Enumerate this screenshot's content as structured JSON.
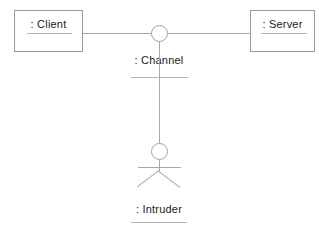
{
  "diagram": {
    "type": "uml-deployment-collaboration",
    "background_color": "#ffffff",
    "line_color": "#a8a8a8",
    "text_color": "#1a1a1a",
    "nodes": [
      {
        "id": "client",
        "shape": "rectangle",
        "label": ": Client",
        "underlined": true
      },
      {
        "id": "server",
        "shape": "rectangle",
        "label": ": Server",
        "underlined": true
      },
      {
        "id": "channel",
        "shape": "circle",
        "label": ": Channel",
        "underlined": true
      },
      {
        "id": "intruder",
        "shape": "actor",
        "label": ": Intruder",
        "underlined": true
      }
    ],
    "connections": [
      {
        "from": "client",
        "to": "channel",
        "style": "solid"
      },
      {
        "from": "channel",
        "to": "server",
        "style": "solid"
      },
      {
        "from": "channel",
        "to": "intruder",
        "style": "solid"
      }
    ]
  }
}
